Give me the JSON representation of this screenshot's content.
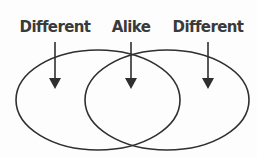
{
  "diagram": {
    "type": "venn",
    "labels": [
      {
        "text": "Different",
        "x": 55
      },
      {
        "text": "Alike",
        "x": 131
      },
      {
        "text": "Different",
        "x": 208
      }
    ],
    "circles": [
      {
        "name": "left",
        "cx": 98,
        "cy": 100,
        "rx": 82,
        "ry": 50
      },
      {
        "name": "right",
        "cx": 167,
        "cy": 100,
        "rx": 82,
        "ry": 50
      }
    ],
    "colors": {
      "stroke": "#2f2f2f",
      "text": "#3a3a3a",
      "background": "#fdfdfd"
    }
  }
}
